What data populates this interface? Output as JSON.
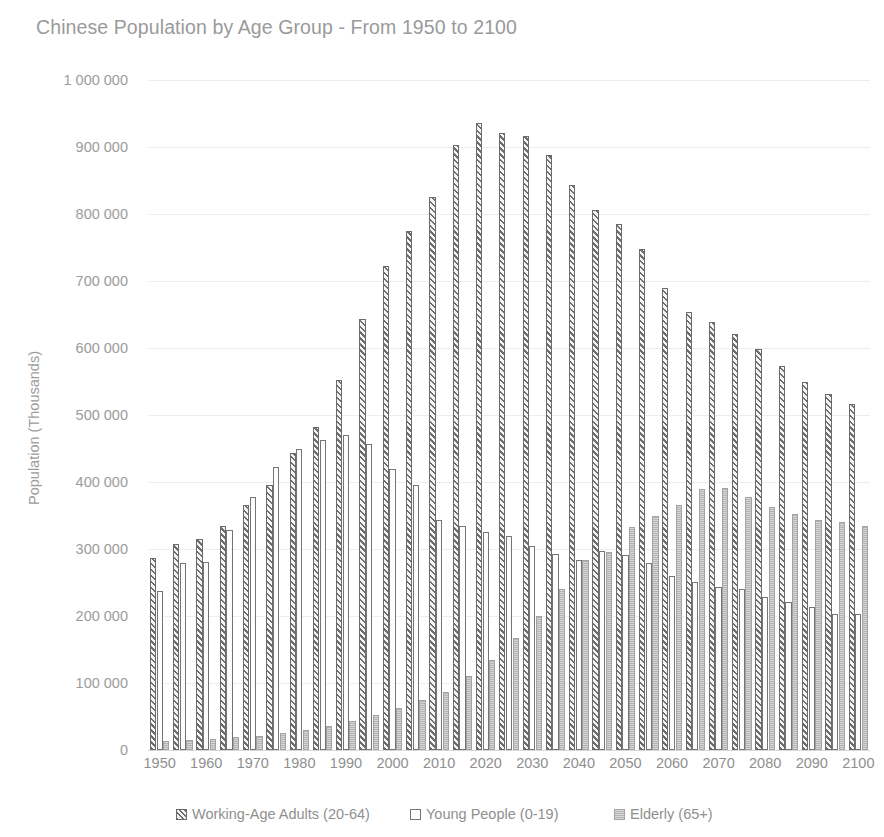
{
  "chart_data": {
    "type": "bar",
    "title": "Chinese Population by Age Group - From 1950 to 2100",
    "xlabel": "",
    "ylabel": "Population (Thousands)",
    "ylim": [
      0,
      1000000
    ],
    "ytick_step": 100000,
    "grid": true,
    "legend_position": "bottom",
    "categories": [
      "1950",
      "1955",
      "1960",
      "1965",
      "1970",
      "1975",
      "1980",
      "1985",
      "1990",
      "1995",
      "2000",
      "2005",
      "2010",
      "2015",
      "2020",
      "2025",
      "2030",
      "2035",
      "2040",
      "2045",
      "2050",
      "2055",
      "2060",
      "2065",
      "2070",
      "2075",
      "2080",
      "2085",
      "2090",
      "2095",
      "2100"
    ],
    "xtick_labels": [
      "1950",
      "1960",
      "1970",
      "1980",
      "1990",
      "2000",
      "2010",
      "2020",
      "2030",
      "2040",
      "2050",
      "2060",
      "2070",
      "2080",
      "2090",
      "2100"
    ],
    "ytick_labels": [
      "1 000 000",
      "900 000",
      "800 000",
      "700 000",
      "600 000",
      "500 000",
      "400 000",
      "300 000",
      "200 000",
      "100 000",
      "0"
    ],
    "ytick_values": [
      1000000,
      900000,
      800000,
      700000,
      600000,
      500000,
      400000,
      300000,
      200000,
      100000,
      0
    ],
    "series": [
      {
        "name": "Working-Age Adults (20-64)",
        "fill": "hatched-diagonal",
        "color": "#6e6e6e",
        "values": [
          287000,
          307000,
          315000,
          335000,
          365000,
          395000,
          443000,
          482000,
          553000,
          644000,
          723000,
          775000,
          826000,
          903000,
          936000,
          921000,
          916000,
          888000,
          844000,
          806000,
          785000,
          748000,
          689000,
          654000,
          639000,
          621000,
          599000,
          573000,
          550000,
          531000,
          516000
        ]
      },
      {
        "name": "Young People (0-19)",
        "fill": "outline-white",
        "color": "#ffffff",
        "values": [
          237000,
          279000,
          281000,
          328000,
          377000,
          422000,
          450000,
          462000,
          470000,
          457000,
          420000,
          395000,
          344000,
          334000,
          325000,
          320000,
          305000,
          293000,
          284000,
          297000,
          291000,
          279000,
          259000,
          251000,
          244000,
          240000,
          229000,
          221000,
          213000,
          203000,
          203000
        ]
      },
      {
        "name": "Elderly (65+)",
        "fill": "solid-gray",
        "color": "#b4b4b4",
        "values": [
          13000,
          15000,
          17000,
          19000,
          21000,
          25000,
          30000,
          36000,
          43000,
          52000,
          62000,
          75000,
          87000,
          111000,
          135000,
          167000,
          200000,
          241000,
          283000,
          296000,
          333000,
          350000,
          366000,
          390000,
          391000,
          377000,
          363000,
          352000,
          344000,
          341000,
          334000
        ]
      }
    ],
    "notes": {
      "peak_working_age_year": "2020",
      "peak_working_age_value": 936000,
      "crossover_elderly_over_young": "2040"
    }
  }
}
